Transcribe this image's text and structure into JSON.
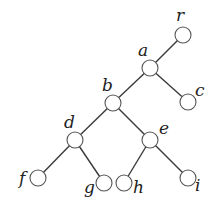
{
  "diagram": {
    "type": "rooted-tree",
    "node_radius": 8,
    "nodes": [
      {
        "id": "r",
        "label": "r",
        "x": 183,
        "y": 35,
        "lx": 176,
        "ly": 21
      },
      {
        "id": "a",
        "label": "a",
        "x": 150,
        "y": 68,
        "lx": 138,
        "ly": 56
      },
      {
        "id": "b",
        "label": "b",
        "x": 113,
        "y": 103,
        "lx": 102,
        "ly": 91
      },
      {
        "id": "c",
        "label": "c",
        "x": 188,
        "y": 102,
        "lx": 195,
        "ly": 96
      },
      {
        "id": "d",
        "label": "d",
        "x": 75,
        "y": 140,
        "lx": 64,
        "ly": 128
      },
      {
        "id": "e",
        "label": "e",
        "x": 150,
        "y": 140,
        "lx": 159,
        "ly": 134
      },
      {
        "id": "f",
        "label": "f",
        "x": 38,
        "y": 178,
        "lx": 19,
        "ly": 184
      },
      {
        "id": "g",
        "label": "g",
        "x": 104,
        "y": 183,
        "lx": 84,
        "ly": 193
      },
      {
        "id": "h",
        "label": "h",
        "x": 124,
        "y": 183,
        "lx": 133,
        "ly": 193
      },
      {
        "id": "i",
        "label": "i",
        "x": 188,
        "y": 178,
        "lx": 195,
        "ly": 191
      }
    ],
    "edges": [
      [
        "r",
        "a"
      ],
      [
        "a",
        "b"
      ],
      [
        "a",
        "c"
      ],
      [
        "b",
        "d"
      ],
      [
        "b",
        "e"
      ],
      [
        "d",
        "f"
      ],
      [
        "d",
        "g"
      ],
      [
        "e",
        "h"
      ],
      [
        "e",
        "i"
      ]
    ]
  }
}
